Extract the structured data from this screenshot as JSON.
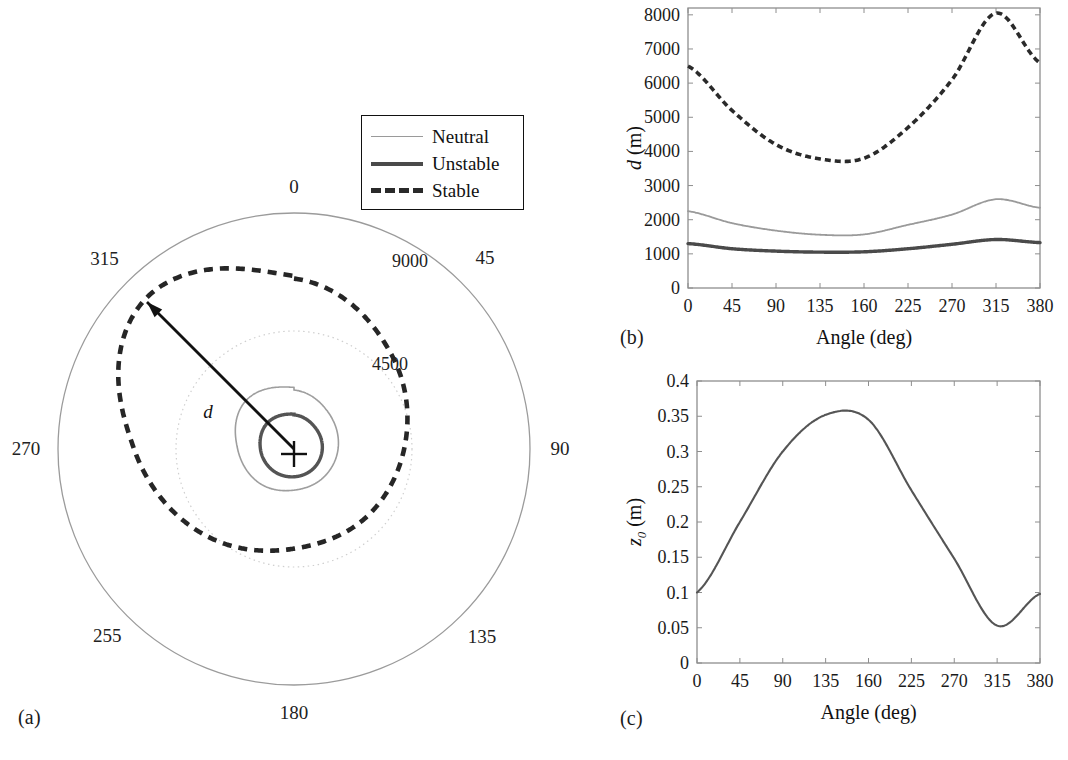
{
  "figure": {
    "panel_labels": {
      "a": "(a)",
      "b": "(b)",
      "c": "(c)"
    }
  },
  "legend": {
    "items": [
      {
        "label": "Neutral",
        "style": "thin-solid",
        "color": "#9a9a9a"
      },
      {
        "label": "Unstable",
        "style": "thick-solid",
        "color": "#4a4a4a"
      },
      {
        "label": "Stable",
        "style": "thick-dashed",
        "color": "#2a2a2a"
      }
    ]
  },
  "panel_a": {
    "type": "polar",
    "angle_labels": [
      "0",
      "45",
      "90",
      "135",
      "180",
      "255",
      "270",
      "315"
    ],
    "angle_values_deg": [
      0,
      45,
      90,
      135,
      180,
      225,
      270,
      315
    ],
    "radial_labels": [
      "4500",
      "9000"
    ],
    "radial_values": [
      4500,
      9000
    ],
    "annotation": "d",
    "center_marker": "+",
    "arrow_angle_deg": 315,
    "arrow_label": "d"
  },
  "chart_data": [
    {
      "panel": "(b)",
      "type": "line",
      "title": "",
      "xlabel": "Angle (deg)",
      "ylabel": "d (m)",
      "categories": [
        "0",
        "45",
        "90",
        "135",
        "160",
        "225",
        "270",
        "315",
        "380"
      ],
      "x": [
        0,
        45,
        90,
        135,
        160,
        225,
        270,
        315,
        380
      ],
      "xtick_labels": [
        "0",
        "45",
        "90",
        "135",
        "160",
        "225",
        "270",
        "315",
        "380"
      ],
      "ytick_labels": [
        "0",
        "1000",
        "2000",
        "3000",
        "4000",
        "5000",
        "6000",
        "7000",
        "8000"
      ],
      "ylim": [
        0,
        8200
      ],
      "grid": false,
      "legend_position": "external-panel-a",
      "series": [
        {
          "name": "Stable",
          "color": "#2a2a2a",
          "style": "thick-dashed",
          "values": [
            6500,
            5200,
            4200,
            3780,
            3800,
            4700,
            6100,
            8050,
            6600
          ]
        },
        {
          "name": "Neutral",
          "color": "#9a9a9a",
          "style": "thin-solid",
          "values": [
            2250,
            1900,
            1680,
            1560,
            1570,
            1850,
            2150,
            2600,
            2350
          ]
        },
        {
          "name": "Unstable",
          "color": "#4a4a4a",
          "style": "thick-solid",
          "values": [
            1300,
            1150,
            1080,
            1050,
            1060,
            1150,
            1280,
            1420,
            1330
          ]
        }
      ]
    },
    {
      "panel": "(c)",
      "type": "line",
      "title": "",
      "xlabel": "Angle (deg)",
      "ylabel": "z0 (m)",
      "categories": [
        "0",
        "45",
        "90",
        "135",
        "160",
        "225",
        "270",
        "315",
        "380"
      ],
      "x": [
        0,
        45,
        90,
        135,
        160,
        225,
        270,
        315,
        380
      ],
      "xtick_labels": [
        "0",
        "45",
        "90",
        "135",
        "160",
        "225",
        "270",
        "315",
        "380"
      ],
      "ytick_labels": [
        "0",
        "0.05",
        "0.1",
        "0.15",
        "0.2",
        "0.25",
        "0.3",
        "0.35",
        "0.4"
      ],
      "ylim": [
        0,
        0.4
      ],
      "grid": false,
      "series": [
        {
          "name": "z0",
          "color": "#555555",
          "style": "solid",
          "values": [
            0.1,
            0.2,
            0.3,
            0.352,
            0.345,
            0.245,
            0.148,
            0.053,
            0.098
          ]
        }
      ]
    }
  ]
}
